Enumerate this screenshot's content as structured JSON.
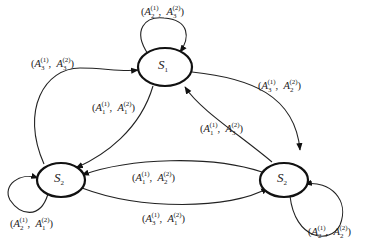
{
  "diagram": {
    "type": "state-transition-graph",
    "nodes": [
      {
        "id": "top",
        "base": "S",
        "sub": "1"
      },
      {
        "id": "left",
        "base": "S",
        "sub": "2"
      },
      {
        "id": "right",
        "base": "S",
        "sub": "2"
      }
    ],
    "edges": [
      {
        "id": "loop-top",
        "from": "top",
        "to": "top",
        "label": {
          "a": "2",
          "asup": "(1)",
          "b": "3",
          "bsup": "(2)"
        }
      },
      {
        "id": "left-to-top",
        "from": "left",
        "to": "top",
        "label": {
          "a": "3",
          "asup": "(1)",
          "b": "3",
          "bsup": "(2)"
        }
      },
      {
        "id": "top-to-right",
        "from": "top",
        "to": "right",
        "label": {
          "a": "3",
          "asup": "(1)",
          "b": "2",
          "bsup": "(2)"
        }
      },
      {
        "id": "top-to-left",
        "from": "top",
        "to": "left",
        "label": {
          "a": "1",
          "asup": "(1)",
          "b": "1",
          "bsup": "(2)"
        }
      },
      {
        "id": "right-to-top",
        "from": "right",
        "to": "top",
        "label": {
          "a": "1",
          "asup": "(1)",
          "b": "3",
          "bsup": "(2)"
        }
      },
      {
        "id": "right-to-left-upper",
        "from": "right",
        "to": "left",
        "label": {
          "a": "1",
          "asup": "(1)",
          "b": "2",
          "bsup": "(2)"
        }
      },
      {
        "id": "left-to-right-lower",
        "from": "left",
        "to": "right",
        "label": {
          "a": "3",
          "asup": "(1)",
          "b": "1",
          "bsup": "(2)"
        }
      },
      {
        "id": "loop-left",
        "from": "left",
        "to": "left",
        "label": {
          "a": "2",
          "asup": "(1)",
          "b": "1",
          "bsup": "(2)"
        }
      },
      {
        "id": "loop-right",
        "from": "right",
        "to": "right",
        "label": {
          "a": "2",
          "asup": "(1)",
          "b": "2",
          "bsup": "(2)"
        }
      }
    ],
    "symbol": "A",
    "separator": ","
  }
}
